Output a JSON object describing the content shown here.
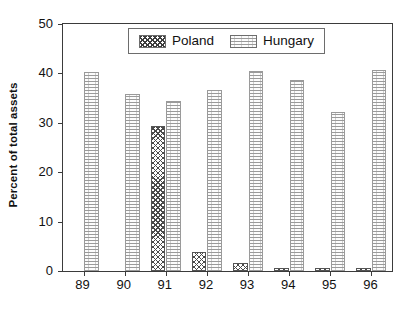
{
  "chart_data": {
    "type": "bar",
    "title": "",
    "subtitle": "",
    "xlabel": "",
    "ylabel": "Percent of total assets",
    "categories": [
      "89",
      "90",
      "91",
      "92",
      "93",
      "94",
      "95",
      "96"
    ],
    "series": [
      {
        "name": "Poland",
        "values": [
          0,
          0,
          29.4,
          3.8,
          1.6,
          0.4,
          0.5,
          0.5
        ]
      },
      {
        "name": "Hungary",
        "values": [
          40.2,
          35.9,
          34.5,
          36.7,
          40.4,
          38.7,
          32.1,
          40.6
        ]
      }
    ],
    "ylim": [
      0,
      50
    ],
    "yticks": [
      "0",
      "10",
      "20",
      "30",
      "40",
      "50"
    ],
    "ytick_values": [
      0,
      10,
      20,
      30,
      40,
      50
    ],
    "grid": false,
    "legend_position": "top-center",
    "legend": [
      "Poland",
      "Hungary"
    ],
    "annotations": []
  },
  "legend": {
    "entries": [
      {
        "label": "Poland",
        "swatch": "crosshatch-swatch"
      },
      {
        "label": "Hungary",
        "swatch": "horizontal-lines-swatch"
      }
    ]
  },
  "axes": {
    "y_title": "Percent of total assets"
  }
}
